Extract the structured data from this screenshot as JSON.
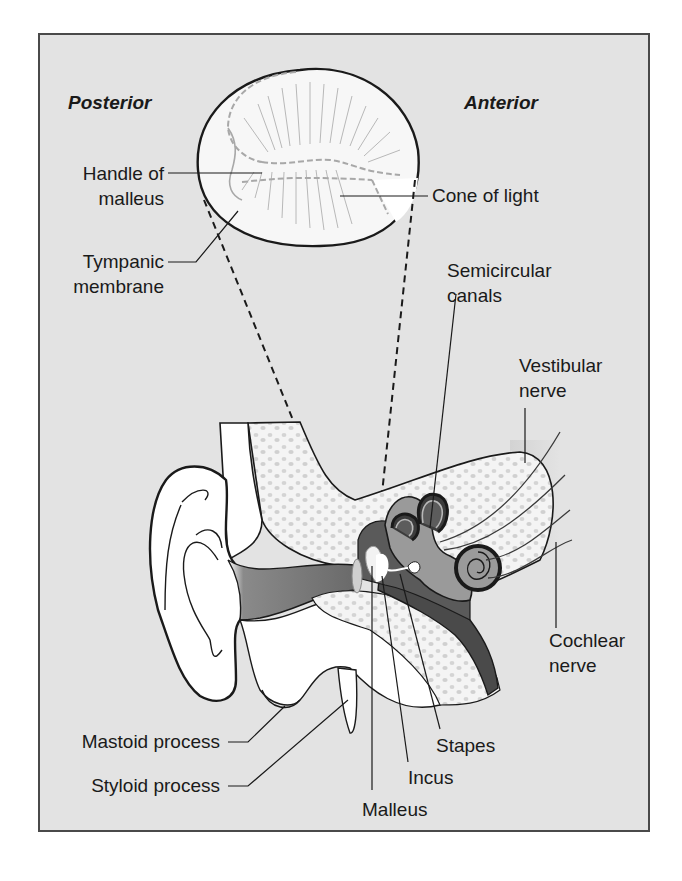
{
  "figure": {
    "orientation_labels": {
      "left": "Posterior",
      "right": "Anterior"
    },
    "tympanic_membrane_labels": [
      {
        "id": "handle-of-malleus",
        "lines": [
          "Handle of",
          "malleus"
        ]
      },
      {
        "id": "tympanic-membrane",
        "lines": [
          "Tympanic",
          "membrane"
        ]
      },
      {
        "id": "cone-of-light",
        "lines": [
          "Cone of light"
        ]
      }
    ],
    "ear_labels": [
      {
        "id": "semicircular-canals",
        "lines": [
          "Semicircular",
          "canals"
        ]
      },
      {
        "id": "vestibular-nerve",
        "lines": [
          "Vestibular",
          "nerve"
        ]
      },
      {
        "id": "cochlear-nerve",
        "lines": [
          "Cochlear",
          "nerve"
        ]
      },
      {
        "id": "mastoid-process",
        "lines": [
          "Mastoid process"
        ]
      },
      {
        "id": "styloid-process",
        "lines": [
          "Styloid process"
        ]
      },
      {
        "id": "stapes",
        "lines": [
          "Stapes"
        ]
      },
      {
        "id": "incus",
        "lines": [
          "Incus"
        ]
      },
      {
        "id": "malleus",
        "lines": [
          "Malleus"
        ]
      }
    ],
    "colors": {
      "background": "#e3e3e3",
      "border": "#4a4a4a",
      "outline": "#1a1a1a",
      "canal_dark": "#5a5a5a",
      "inner_ear_dark": "#3c3c3c",
      "inner_ear_mid": "#9a9a9a",
      "bone_fill": "#f2f2f2",
      "membrane_fill": "#f7f7f7"
    }
  }
}
